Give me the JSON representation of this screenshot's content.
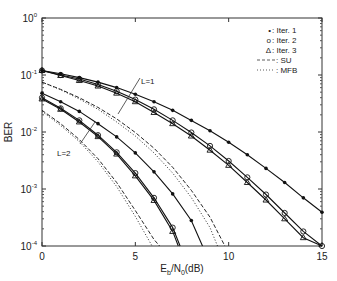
{
  "chart_data": {
    "type": "line",
    "title": "",
    "xlabel": "Eb/N0(dB)",
    "xlabel_parts": {
      "E": "E",
      "b": "b",
      "slash": "/N",
      "zero": "0",
      "unit": "(dB)"
    },
    "ylabel": "BER",
    "yscale": "log",
    "xlim": [
      0,
      15
    ],
    "ylim": [
      0.0001,
      1
    ],
    "x_ticks": [
      0,
      5,
      10,
      15
    ],
    "y_ticks": [
      {
        "base": "10",
        "exp": "0"
      },
      {
        "base": "10",
        "exp": "-1"
      },
      {
        "base": "10",
        "exp": "-2"
      },
      {
        "base": "10",
        "exp": "-3"
      },
      {
        "base": "10",
        "exp": "-4"
      }
    ],
    "grid": false,
    "legend_position": "upper right",
    "legend": [
      {
        "marker": "*",
        "label": ": Iter. 1"
      },
      {
        "marker": "o",
        "label": ": Iter. 2"
      },
      {
        "marker": "Δ",
        "label": ": Iter. 3"
      },
      {
        "line": "dashed",
        "label": ": SU"
      },
      {
        "line": "dotted",
        "label": ": MFB"
      }
    ],
    "annotations": [
      {
        "text": "L=1"
      },
      {
        "text": "L=2"
      }
    ],
    "series": [
      {
        "name": "L=1 Iter. 1",
        "marker": "*",
        "x": [
          0,
          1,
          2,
          3,
          4,
          5,
          6,
          7,
          8,
          9,
          10,
          11,
          12,
          13,
          14,
          15
        ],
        "y": [
          0.12,
          0.105,
          0.09,
          0.075,
          0.06,
          0.046,
          0.034,
          0.024,
          0.016,
          0.0105,
          0.0066,
          0.004,
          0.0023,
          0.0013,
          0.0007,
          0.00039
        ]
      },
      {
        "name": "L=1 Iter. 2",
        "marker": "o",
        "x": [
          0,
          1,
          2,
          3,
          4,
          5,
          6,
          7,
          8,
          9,
          10,
          11,
          12,
          13,
          14,
          15
        ],
        "y": [
          0.12,
          0.1,
          0.085,
          0.068,
          0.052,
          0.037,
          0.025,
          0.016,
          0.0098,
          0.0057,
          0.0031,
          0.0016,
          0.0008,
          0.00038,
          0.00018,
          0.0001
        ]
      },
      {
        "name": "L=1 Iter. 3",
        "marker": "Δ",
        "x": [
          0,
          1,
          2,
          3,
          4,
          5,
          6,
          7,
          8,
          9,
          10,
          11,
          12,
          13,
          14,
          15
        ],
        "y": [
          0.12,
          0.098,
          0.08,
          0.064,
          0.048,
          0.034,
          0.022,
          0.014,
          0.0085,
          0.0048,
          0.0026,
          0.0013,
          0.00064,
          0.0003,
          0.00014,
          8e-05
        ]
      },
      {
        "name": "L=1 SU",
        "line": "dashed",
        "x": [
          0,
          1,
          2,
          3,
          4,
          5,
          6,
          7,
          8,
          9,
          9.8
        ],
        "y": [
          0.075,
          0.056,
          0.04,
          0.027,
          0.017,
          0.0098,
          0.0052,
          0.0024,
          0.00095,
          0.00032,
          0.0001
        ]
      },
      {
        "name": "L=1 MFB",
        "line": "dotted",
        "x": [
          0,
          1,
          2,
          3,
          4,
          5,
          6,
          7,
          8,
          9,
          9.4
        ],
        "y": [
          0.075,
          0.055,
          0.038,
          0.025,
          0.015,
          0.0085,
          0.0043,
          0.0019,
          0.00071,
          0.00021,
          0.0001
        ]
      },
      {
        "name": "L=2 Iter. 1",
        "marker": "*",
        "x": [
          0,
          1,
          2,
          3,
          4,
          5,
          6,
          7,
          8,
          8.6
        ],
        "y": [
          0.048,
          0.034,
          0.023,
          0.014,
          0.0082,
          0.0043,
          0.002,
          0.00082,
          0.00028,
          0.0001
        ]
      },
      {
        "name": "L=2 Iter. 2",
        "marker": "o",
        "x": [
          0,
          1,
          2,
          3,
          4,
          5,
          6,
          7,
          7.4
        ],
        "y": [
          0.04,
          0.026,
          0.016,
          0.0088,
          0.0044,
          0.0019,
          0.0007,
          0.00021,
          0.0001
        ]
      },
      {
        "name": "L=2 Iter. 3",
        "marker": "Δ",
        "x": [
          0,
          1,
          2,
          3,
          4,
          5,
          6,
          7,
          7.3
        ],
        "y": [
          0.038,
          0.025,
          0.015,
          0.0083,
          0.0041,
          0.0017,
          0.00063,
          0.00018,
          0.0001
        ]
      },
      {
        "name": "L=2 SU",
        "line": "dashed",
        "x": [
          0,
          1,
          2,
          3,
          4,
          5,
          6,
          6.3
        ],
        "y": [
          0.024,
          0.014,
          0.0074,
          0.0034,
          0.0013,
          0.00042,
          0.00013,
          0.0001
        ]
      },
      {
        "name": "L=2 MFB",
        "line": "dotted",
        "x": [
          0,
          1,
          2,
          3,
          4,
          5,
          5.9
        ],
        "y": [
          0.023,
          0.013,
          0.0068,
          0.003,
          0.0011,
          0.00033,
          0.0001
        ]
      }
    ]
  }
}
